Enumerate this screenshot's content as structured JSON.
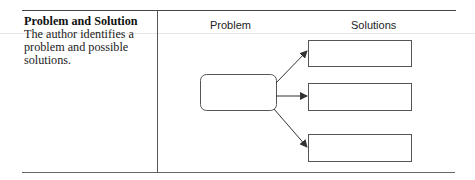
{
  "organizer": {
    "type_title": "Problem and Solution",
    "type_description": "The author identifies a problem and possible solutions.",
    "column_headers": {
      "problem": "Problem",
      "solutions": "Solutions"
    },
    "diagram": {
      "problem_box": {
        "label": ""
      },
      "solution_boxes": [
        {
          "label": ""
        },
        {
          "label": ""
        },
        {
          "label": ""
        }
      ],
      "stroke_color": "#555555",
      "arrow_color": "#333333"
    }
  }
}
